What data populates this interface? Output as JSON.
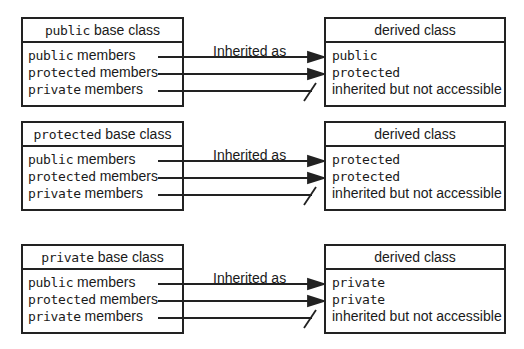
{
  "arrow_label": "Inherited as",
  "groups": [
    {
      "base": {
        "keyword": "public",
        "suffix": " base class"
      },
      "members": [
        {
          "keyword": "public",
          "suffix": " members"
        },
        {
          "keyword": "protected",
          "suffix": " members"
        },
        {
          "keyword": "private",
          "suffix": " members"
        }
      ],
      "derived": {
        "title": "derived class",
        "rows": [
          "public",
          "protected",
          "inherited but not accessible"
        ]
      }
    },
    {
      "base": {
        "keyword": "protected",
        "suffix": " base class"
      },
      "members": [
        {
          "keyword": "public",
          "suffix": " members"
        },
        {
          "keyword": "protected",
          "suffix": " members"
        },
        {
          "keyword": "private",
          "suffix": " members"
        }
      ],
      "derived": {
        "title": "derived class",
        "rows": [
          "protected",
          "protected",
          "inherited but not accessible"
        ]
      }
    },
    {
      "base": {
        "keyword": "private",
        "suffix": " base class"
      },
      "members": [
        {
          "keyword": "public",
          "suffix": " members"
        },
        {
          "keyword": "protected",
          "suffix": " members"
        },
        {
          "keyword": "private",
          "suffix": " members"
        }
      ],
      "derived": {
        "title": "derived class",
        "rows": [
          "private",
          "private",
          "inherited but not accessible"
        ]
      }
    }
  ]
}
